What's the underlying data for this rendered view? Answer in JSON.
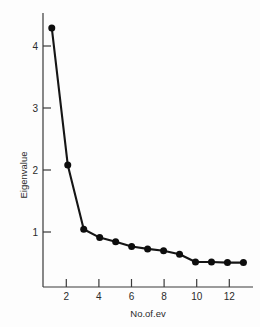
{
  "chart_data": {
    "type": "line",
    "title": "",
    "subtitle": "",
    "xlabel": "No.of.ev",
    "ylabel": "Eigenvalue",
    "x": [
      1,
      2,
      3,
      4,
      5,
      6,
      7,
      8,
      9,
      10,
      11,
      12,
      13
    ],
    "values": [
      4.35,
      2.05,
      0.97,
      0.83,
      0.76,
      0.68,
      0.64,
      0.61,
      0.55,
      0.42,
      0.42,
      0.41,
      0.41
    ],
    "series": [
      {
        "name": "Eigenvalue",
        "values": [
          4.35,
          2.05,
          0.97,
          0.83,
          0.76,
          0.68,
          0.64,
          0.61,
          0.55,
          0.42,
          0.42,
          0.41,
          0.41
        ]
      }
    ],
    "xticks": [
      2,
      4,
      6,
      8,
      10,
      12
    ],
    "xtick_labels": [
      "2",
      "4",
      "6",
      "8",
      "10",
      "12"
    ],
    "yticks": [
      1,
      2,
      3,
      4
    ],
    "ytick_labels": [
      "1",
      "2",
      "3",
      "4"
    ],
    "xlim": [
      0.45,
      13.6
    ],
    "ylim": [
      0.0,
      4.6
    ],
    "grid": false,
    "legend": false,
    "legend_position": "none",
    "marker": "filled-circle",
    "line_color": "#151515",
    "marker_color": "#0d0d0d",
    "background_color": "#fdfdfd",
    "annotations": []
  },
  "figure": {
    "caption": ""
  }
}
